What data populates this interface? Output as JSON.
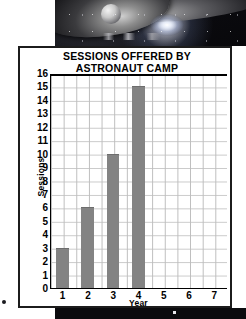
{
  "photo": {
    "alt_name": "space-scene-photo",
    "description": "dark space scene with spacecraft silhouette and bright glowing star"
  },
  "chart_data": {
    "type": "bar",
    "title": "SESSIONS OFFERED BY ASTRONAUT CAMP",
    "title_lines": [
      "SESSIONS OFFERED BY",
      "ASTRONAUT CAMP"
    ],
    "xlabel": "Year",
    "ylabel": "Sessions",
    "categories": [
      "1",
      "2",
      "3",
      "4",
      "5",
      "6",
      "7"
    ],
    "values": [
      3,
      6,
      10,
      15,
      0,
      0,
      0
    ],
    "ylim": [
      0,
      16
    ],
    "ytick_labels": [
      "0",
      "1",
      "2",
      "3",
      "4",
      "5",
      "6",
      "7",
      "8",
      "9",
      "10",
      "11",
      "12",
      "13",
      "14",
      "15",
      "16"
    ],
    "xtick_labels": [
      "1",
      "2",
      "3",
      "4",
      "5",
      "6",
      "7"
    ],
    "grid": true,
    "legend": null,
    "bar_color": "#838383",
    "axis_color": "#000000",
    "grid_color": "#c4c4c4",
    "background": "#ffffff"
  }
}
